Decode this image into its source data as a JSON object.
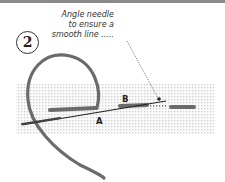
{
  "figure": {
    "step_number": "2",
    "annotation": "Angle needle to ensure a smooth line .....",
    "annotation_lines": [
      "Angle needle",
      "to ensure a",
      "smooth line ....."
    ],
    "labels": {
      "a": "A",
      "b": "B"
    },
    "colors": {
      "thread": "#6b6b6b",
      "fabric_dot": "#cfcfcf",
      "needle": "#222222",
      "frame": "#8a8a8a"
    }
  }
}
